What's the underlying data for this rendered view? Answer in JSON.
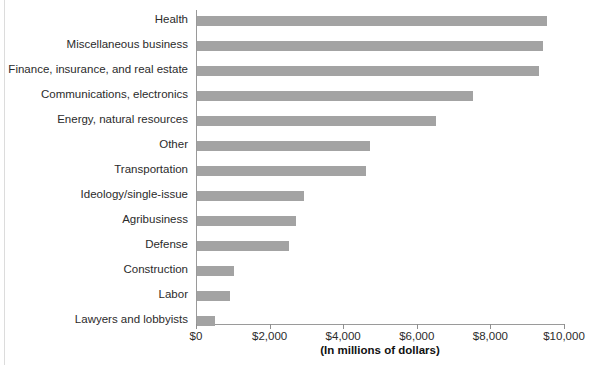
{
  "chart_data": {
    "type": "bar",
    "orientation": "horizontal",
    "title": "",
    "subtitle": "",
    "xlabel": "(In millions of dollars)",
    "ylabel": "",
    "xlim": [
      0,
      10000
    ],
    "xticks": [
      0,
      2000,
      4000,
      6000,
      8000,
      10000
    ],
    "xticklabels": [
      "$0",
      "$2,000",
      "$4,000",
      "$6,000",
      "$8,000",
      "$10,000"
    ],
    "grid": false,
    "legend": null,
    "bar_color": "#a3a3a3",
    "axis_color": "#9a9a9a",
    "categories": [
      "Health",
      "Miscellaneous business",
      "Finance, insurance, and real estate",
      "Communications, electronics",
      "Energy, natural resources",
      "Other",
      "Transportation",
      "Ideology/single-issue",
      "Agribusiness",
      "Defense",
      "Construction",
      "Labor",
      "Lawyers and lobbyists"
    ],
    "values": [
      9500,
      9400,
      9300,
      7500,
      6500,
      4700,
      4600,
      2900,
      2700,
      2500,
      1000,
      900,
      500
    ]
  }
}
